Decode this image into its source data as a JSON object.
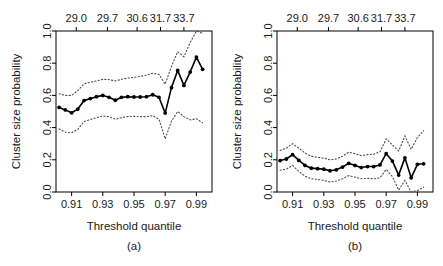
{
  "figure": {
    "panels": [
      {
        "id": "a",
        "caption": "(a)",
        "xlabel": "Threshold quantile",
        "ylabel": "Cluster size probability"
      },
      {
        "id": "b",
        "caption": "(b)",
        "xlabel": "Threshold quantile",
        "ylabel": "Cluster size probability"
      }
    ]
  },
  "chart_data": [
    {
      "type": "line",
      "panel": "(a)",
      "title": "",
      "xlabel": "Threshold quantile",
      "ylabel": "Cluster size probability",
      "xlim": [
        0.9,
        1.0
      ],
      "ylim": [
        0.0,
        1.0
      ],
      "grid": false,
      "legend": "none",
      "xticks": [
        0.91,
        0.93,
        0.95,
        0.97,
        0.99
      ],
      "xtick_labels": [
        "0.91",
        "0.93",
        "0.95",
        "0.97",
        "0.99"
      ],
      "yticks": [
        0.0,
        0.2,
        0.4,
        0.6,
        0.8,
        1.0
      ],
      "ytick_labels": [
        "0.0",
        "0.2",
        "0.4",
        "0.6",
        "0.8",
        "1.0"
      ],
      "secondary_xaxis": {
        "label": "",
        "ticks": [
          0.913,
          0.933,
          0.952,
          0.967,
          0.982
        ],
        "tick_labels": [
          "29.0",
          "29.7",
          "30.6",
          "31.7",
          "33.7"
        ]
      },
      "x": [
        0.902,
        0.906,
        0.91,
        0.914,
        0.918,
        0.922,
        0.926,
        0.93,
        0.934,
        0.938,
        0.942,
        0.946,
        0.95,
        0.954,
        0.958,
        0.962,
        0.966,
        0.97,
        0.974,
        0.978,
        0.982,
        0.986,
        0.99,
        0.994
      ],
      "series": [
        {
          "name": "Estimate",
          "style": "solid-with-markers",
          "values": [
            0.525,
            0.51,
            0.492,
            0.515,
            0.568,
            0.58,
            0.592,
            0.6,
            0.588,
            0.57,
            0.588,
            0.592,
            0.59,
            0.59,
            0.592,
            0.604,
            0.588,
            0.49,
            0.648,
            0.755,
            0.662,
            0.745,
            0.838,
            0.762
          ]
        },
        {
          "name": "Upper confidence band",
          "style": "dotted",
          "values": [
            0.61,
            0.6,
            0.6,
            0.63,
            0.672,
            0.682,
            0.69,
            0.7,
            0.698,
            0.69,
            0.7,
            0.708,
            0.712,
            0.718,
            0.726,
            0.738,
            0.73,
            0.67,
            0.78,
            0.872,
            0.84,
            0.928,
            1.0,
            0.985
          ]
        },
        {
          "name": "Lower confidence band",
          "style": "dotted",
          "values": [
            0.392,
            0.372,
            0.368,
            0.39,
            0.438,
            0.45,
            0.462,
            0.472,
            0.468,
            0.452,
            0.462,
            0.468,
            0.47,
            0.468,
            0.468,
            0.474,
            0.452,
            0.33,
            0.44,
            0.5,
            0.468,
            0.448,
            0.455,
            0.43
          ]
        }
      ]
    },
    {
      "type": "line",
      "panel": "(b)",
      "title": "",
      "xlabel": "Threshold quantile",
      "ylabel": "Cluster size probability",
      "xlim": [
        0.9,
        1.0
      ],
      "ylim": [
        0.0,
        1.0
      ],
      "grid": false,
      "legend": "none",
      "xticks": [
        0.91,
        0.93,
        0.95,
        0.97,
        0.99
      ],
      "xtick_labels": [
        "0.91",
        "0.93",
        "0.95",
        "0.97",
        "0.99"
      ],
      "yticks": [
        0.0,
        0.2,
        0.4,
        0.6,
        0.8,
        1.0
      ],
      "ytick_labels": [
        "0.0",
        "0.2",
        "0.4",
        "0.6",
        "0.8",
        "1.0"
      ],
      "secondary_xaxis": {
        "label": "",
        "ticks": [
          0.913,
          0.933,
          0.952,
          0.967,
          0.982
        ],
        "tick_labels": [
          "29.0",
          "29.7",
          "30.6",
          "31.7",
          "33.7"
        ]
      },
      "x": [
        0.902,
        0.906,
        0.91,
        0.914,
        0.918,
        0.922,
        0.926,
        0.93,
        0.934,
        0.938,
        0.942,
        0.946,
        0.95,
        0.954,
        0.958,
        0.962,
        0.966,
        0.97,
        0.974,
        0.978,
        0.982,
        0.986,
        0.99,
        0.994
      ],
      "series": [
        {
          "name": "Estimate",
          "style": "solid-with-markers",
          "values": [
            0.195,
            0.205,
            0.232,
            0.196,
            0.165,
            0.148,
            0.145,
            0.142,
            0.132,
            0.138,
            0.155,
            0.178,
            0.165,
            0.152,
            0.158,
            0.158,
            0.168,
            0.238,
            0.192,
            0.105,
            0.212,
            0.088,
            0.172,
            0.175
          ]
        },
        {
          "name": "Upper confidence band",
          "style": "dotted",
          "values": [
            0.258,
            0.272,
            0.3,
            0.272,
            0.242,
            0.222,
            0.215,
            0.21,
            0.2,
            0.205,
            0.222,
            0.248,
            0.238,
            0.226,
            0.232,
            0.235,
            0.25,
            0.33,
            0.292,
            0.255,
            0.348,
            0.265,
            0.338,
            0.382
          ]
        },
        {
          "name": "Lower confidence band",
          "style": "dotted",
          "values": [
            0.135,
            0.142,
            0.165,
            0.128,
            0.098,
            0.082,
            0.078,
            0.072,
            0.062,
            0.068,
            0.082,
            0.102,
            0.092,
            0.082,
            0.085,
            0.082,
            0.088,
            0.14,
            0.095,
            0.012,
            0.072,
            0.0,
            0.008,
            0.03
          ]
        }
      ]
    }
  ]
}
